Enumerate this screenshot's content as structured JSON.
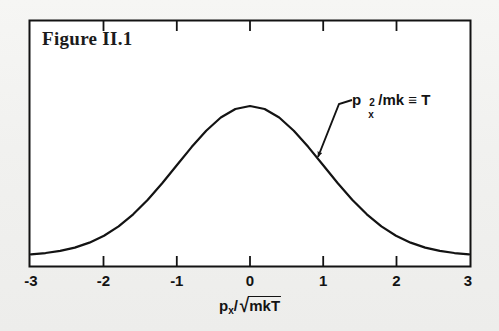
{
  "figure": {
    "title": "Figure II.1",
    "background_color": "#f2f2f0",
    "ink_color": "#131313"
  },
  "annotation": {
    "base": "p",
    "superscript": "2",
    "subscript": "x",
    "rest": " /mk ≡ T",
    "full_text": "p²ₓ /mk ≡ T",
    "arrow_target_x": 1.0
  },
  "axis_label": {
    "numerator": "p",
    "numerator_sub": "x",
    "slash": "/",
    "radicand": "mkT",
    "full_text": "pₓ/√mkT"
  },
  "chart_data": {
    "type": "line",
    "title": "Figure II.1",
    "xlabel": "p_x/√(mkT)",
    "ylabel": "",
    "xlim": [
      -3,
      3
    ],
    "ylim": [
      0,
      1
    ],
    "grid": false,
    "legend": null,
    "xticks": [
      -3,
      -2,
      -1,
      0,
      1,
      2,
      3
    ],
    "xticklabels": [
      "-3",
      "-2",
      "-1",
      "0",
      "1",
      "2",
      "3"
    ],
    "yticks": [],
    "yticklabels": [],
    "annotations": [
      {
        "text": "p²ₓ /mk ≡ T",
        "points_to_x": 1.0,
        "points_to_y": 0.6065
      }
    ],
    "series": [
      {
        "name": "Maxwell-Boltzmann momentum distribution exp(-p_x^2/2mkT)",
        "x": [
          -3.0,
          -2.8,
          -2.6,
          -2.4,
          -2.2,
          -2.0,
          -1.8,
          -1.6,
          -1.4,
          -1.2,
          -1.0,
          -0.8,
          -0.6,
          -0.4,
          -0.2,
          0.0,
          0.2,
          0.4,
          0.6,
          0.8,
          1.0,
          1.2,
          1.4,
          1.6,
          1.8,
          2.0,
          2.2,
          2.4,
          2.6,
          2.8,
          3.0
        ],
        "y": [
          0.0111,
          0.0198,
          0.034,
          0.0561,
          0.0889,
          0.1353,
          0.1979,
          0.278,
          0.3753,
          0.4868,
          0.6065,
          0.7261,
          0.8353,
          0.9231,
          0.9802,
          1.0,
          0.9802,
          0.9231,
          0.8353,
          0.7261,
          0.6065,
          0.4868,
          0.3753,
          0.278,
          0.1979,
          0.1353,
          0.0889,
          0.0561,
          0.034,
          0.0198,
          0.0111
        ]
      }
    ]
  }
}
